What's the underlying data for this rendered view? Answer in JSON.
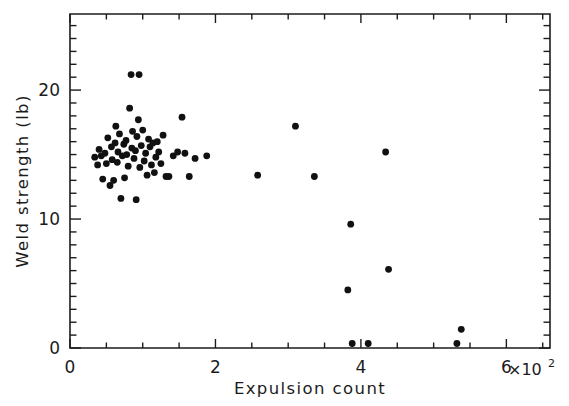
{
  "chart_data": {
    "type": "scatter",
    "title": "",
    "xlabel": "Expulsion count",
    "ylabel": "Weld strength (lb)",
    "x_multiplier_label": "×10",
    "x_multiplier_exponent": "2",
    "xlim": [
      0,
      6.6
    ],
    "ylim": [
      0,
      25.9
    ],
    "xticks": [
      0,
      2,
      4,
      6
    ],
    "xtick_labels": [
      "0",
      "2",
      "4",
      "6"
    ],
    "yticks": [
      0,
      10,
      20
    ],
    "ytick_labels": [
      "0",
      "10",
      "20"
    ],
    "x_minor_tick_step": 0.5,
    "y_minor_tick_step": 1,
    "grid": false,
    "legend": null,
    "marker": "filled-circle",
    "marker_color": "#111111",
    "marker_size_px": 3.4,
    "x_units_note": "x values are in units of 10^2 counts",
    "points": [
      [
        0.34,
        14.8
      ],
      [
        0.38,
        14.2
      ],
      [
        0.4,
        15.4
      ],
      [
        0.43,
        14.9
      ],
      [
        0.45,
        13.1
      ],
      [
        0.48,
        15.1
      ],
      [
        0.5,
        14.3
      ],
      [
        0.52,
        16.3
      ],
      [
        0.55,
        12.6
      ],
      [
        0.57,
        15.6
      ],
      [
        0.58,
        14.6
      ],
      [
        0.6,
        13.0
      ],
      [
        0.62,
        15.9
      ],
      [
        0.63,
        17.2
      ],
      [
        0.65,
        14.4
      ],
      [
        0.66,
        15.2
      ],
      [
        0.68,
        16.6
      ],
      [
        0.7,
        11.6
      ],
      [
        0.72,
        14.9
      ],
      [
        0.74,
        15.8
      ],
      [
        0.75,
        13.2
      ],
      [
        0.77,
        16.1
      ],
      [
        0.78,
        15.0
      ],
      [
        0.8,
        14.1
      ],
      [
        0.82,
        18.6
      ],
      [
        0.84,
        21.2
      ],
      [
        0.85,
        15.5
      ],
      [
        0.86,
        16.8
      ],
      [
        0.88,
        14.7
      ],
      [
        0.9,
        15.3
      ],
      [
        0.91,
        11.5
      ],
      [
        0.92,
        16.4
      ],
      [
        0.94,
        17.7
      ],
      [
        0.95,
        21.2
      ],
      [
        0.96,
        14.0
      ],
      [
        0.98,
        15.7
      ],
      [
        1.0,
        16.9
      ],
      [
        1.02,
        14.5
      ],
      [
        1.04,
        15.1
      ],
      [
        1.06,
        13.4
      ],
      [
        1.08,
        16.2
      ],
      [
        1.1,
        15.6
      ],
      [
        1.12,
        14.2
      ],
      [
        1.14,
        15.9
      ],
      [
        1.16,
        13.6
      ],
      [
        1.18,
        14.8
      ],
      [
        1.2,
        16.0
      ],
      [
        1.22,
        15.2
      ],
      [
        1.25,
        14.3
      ],
      [
        1.28,
        16.5
      ],
      [
        1.32,
        13.3
      ],
      [
        1.36,
        13.3
      ],
      [
        1.42,
        14.9
      ],
      [
        1.48,
        15.2
      ],
      [
        1.54,
        17.9
      ],
      [
        1.58,
        15.1
      ],
      [
        1.64,
        13.3
      ],
      [
        1.72,
        14.7
      ],
      [
        1.88,
        14.9
      ],
      [
        2.58,
        13.4
      ],
      [
        3.1,
        17.2
      ],
      [
        3.36,
        13.3
      ],
      [
        3.82,
        4.5
      ],
      [
        3.86,
        9.6
      ],
      [
        3.88,
        0.35
      ],
      [
        4.1,
        0.35
      ],
      [
        4.34,
        15.2
      ],
      [
        4.38,
        6.1
      ],
      [
        5.32,
        0.35
      ],
      [
        5.38,
        1.45
      ]
    ]
  },
  "axes": {
    "y_label_text": "Weld strength  (lb)",
    "x_label_text": "Expulsion count"
  }
}
